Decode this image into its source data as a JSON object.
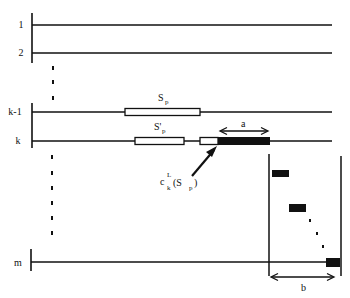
{
  "rows": [
    {
      "label": "1",
      "y": 25
    },
    {
      "label": "2",
      "y": 53
    },
    {
      "label": "k-1",
      "y": 112
    },
    {
      "label": "k",
      "y": 141
    },
    {
      "label": "m",
      "y": 263
    }
  ],
  "segments": {
    "sp_label": "S",
    "sp_sub": "p",
    "sp_prime_label": "S'",
    "sp_prime_sub": "p"
  },
  "annotations": {
    "a_label": "a",
    "b_label": "b",
    "c_main": "c",
    "c_sup": "L",
    "c_sub": "k",
    "c_arg_open": "(S",
    "c_arg_sub": "p",
    "c_arg_close": ")"
  },
  "colors": {
    "line": "#111111",
    "fill_black": "#111111",
    "fill_white": "#ffffff"
  }
}
